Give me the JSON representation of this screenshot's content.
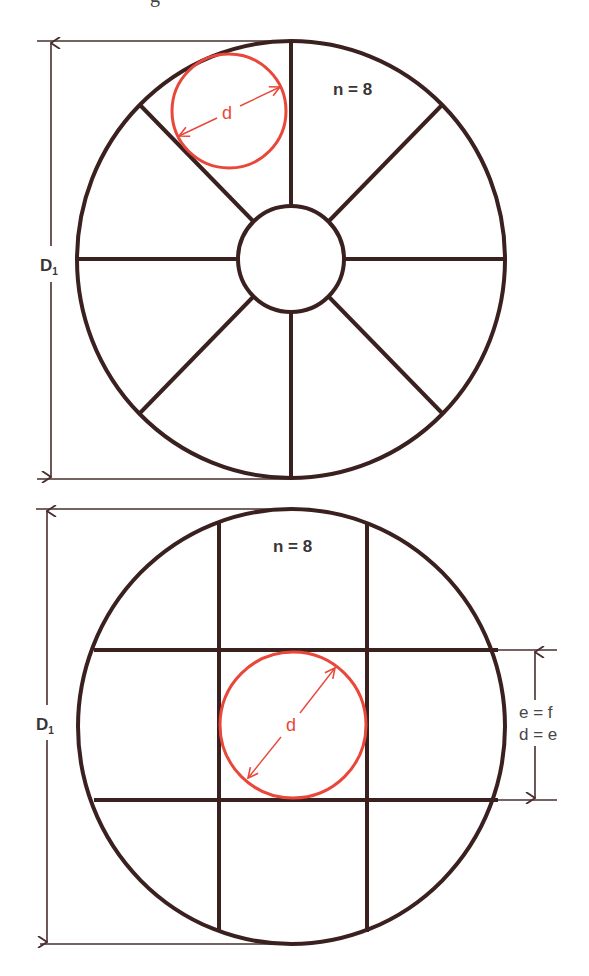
{
  "caption_fragment": "g",
  "colors": {
    "structure": "#3b2020",
    "highlight": "#e8473a",
    "dimension": "#4a2e2e",
    "text": "#3a3535"
  },
  "diagram_radial": {
    "label_n": "n = 8",
    "label_d": "d",
    "label_D": "D",
    "label_D_sub": "1",
    "spokes": 8
  },
  "diagram_grid": {
    "label_n": "n = 8",
    "label_d": "d",
    "label_D": "D",
    "label_D_sub": "1",
    "label_e_f": "e = f",
    "label_d_e": "d = e"
  }
}
